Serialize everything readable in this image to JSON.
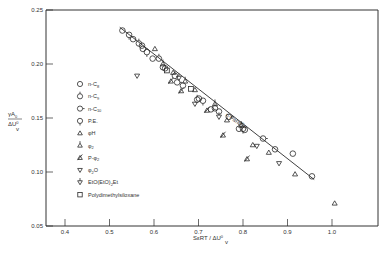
{
  "chart_data": {
    "type": "scatter",
    "title": "",
    "xlabel": "SεRT / ΔU_v^0",
    "ylabel": "γA_0 / ΔU_v^0",
    "xlim": [
      0.34,
      1.09
    ],
    "ylim": [
      0.05,
      0.25
    ],
    "x_ticks": [
      0.4,
      0.5,
      0.6,
      0.7,
      0.8,
      0.9,
      1.0
    ],
    "x_tick_labels": [
      "0.4",
      "0.5",
      "0.6",
      "0.7",
      "0.8",
      "0.9",
      "1.0"
    ],
    "y_ticks": [
      0.05,
      0.1,
      0.15,
      0.2,
      0.25
    ],
    "y_tick_labels": [
      "0.05",
      "0.10",
      "0.15",
      "0.20",
      "0.25"
    ],
    "grid": false,
    "legend_position": "inside-left",
    "reference_line": {
      "label": "n-Paraffin",
      "x": [
        0.523,
        0.96
      ],
      "y": [
        0.234,
        0.093
      ]
    },
    "series": [
      {
        "name": "n-C8",
        "marker": "circle",
        "points": [
          [
            0.529,
            0.231
          ],
          [
            0.553,
            0.223
          ],
          [
            0.573,
            0.217
          ],
          [
            0.597,
            0.205
          ],
          [
            0.625,
            0.196
          ],
          [
            0.665,
            0.18
          ],
          [
            0.701,
            0.168
          ],
          [
            0.746,
            0.156
          ],
          [
            0.804,
            0.139
          ],
          [
            0.872,
            0.121
          ],
          [
            0.912,
            0.117
          ],
          [
            0.955,
            0.096
          ]
        ]
      },
      {
        "name": "n-C9",
        "marker": "circle-tick-top",
        "points": [
          [
            0.566,
            0.219
          ],
          [
            0.611,
            0.205
          ],
          [
            0.647,
            0.189
          ],
          [
            0.697,
            0.167
          ],
          [
            0.737,
            0.159
          ],
          [
            0.791,
            0.14
          ]
        ]
      },
      {
        "name": "n-C10",
        "marker": "circle-tick-right",
        "points": [
          [
            0.575,
            0.214
          ],
          [
            0.62,
            0.197
          ],
          [
            0.652,
            0.183
          ],
          [
            0.728,
            0.158
          ],
          [
            0.768,
            0.151
          ],
          [
            0.845,
            0.131
          ]
        ]
      },
      {
        "name": "P.E.",
        "marker": "circle-tick-bottom",
        "points": [
          [
            0.544,
            0.227
          ],
          [
            0.584,
            0.211
          ],
          [
            0.71,
            0.166
          ],
          [
            0.8,
            0.14
          ]
        ]
      },
      {
        "name": "φH",
        "marker": "triangle-up",
        "points": [
          [
            0.602,
            0.214
          ],
          [
            0.643,
            0.192
          ],
          [
            0.692,
            0.176
          ],
          [
            0.764,
            0.148
          ],
          [
            0.822,
            0.125
          ],
          [
            0.858,
            0.118
          ],
          [
            0.917,
            0.098
          ],
          [
            1.006,
            0.071
          ]
        ]
      },
      {
        "name": "φ2",
        "marker": "triangle-up-tick",
        "points": [
          [
            0.62,
            0.2
          ],
          [
            0.67,
            0.184
          ],
          [
            0.737,
            0.163
          ],
          [
            0.796,
            0.143
          ]
        ]
      },
      {
        "name": "P-φ2",
        "marker": "triangle-up-slash",
        "points": [
          [
            0.638,
            0.184
          ],
          [
            0.661,
            0.175
          ],
          [
            0.719,
            0.157
          ],
          [
            0.755,
            0.134
          ],
          [
            0.809,
            0.112
          ]
        ]
      },
      {
        "name": "φ2O",
        "marker": "triangle-down",
        "points": [
          [
            0.562,
            0.189
          ],
          [
            0.692,
            0.163
          ],
          [
            0.831,
            0.124
          ],
          [
            0.881,
            0.108
          ]
        ]
      },
      {
        "name": "EtO(EtO)2Et",
        "marker": "triangle-down-tick",
        "points": [
          [
            0.656,
            0.187
          ],
          [
            0.746,
            0.151
          ]
        ]
      },
      {
        "name": "Polydimethylsiloxane",
        "marker": "square",
        "points": [
          [
            0.629,
            0.194
          ],
          [
            0.683,
            0.177
          ]
        ]
      }
    ]
  },
  "legend": {
    "items": [
      {
        "label": "n-C",
        "sub": "8",
        "marker": "circle"
      },
      {
        "label": "n-C",
        "sub": "9",
        "marker": "circle-tick-top"
      },
      {
        "label": "n-C",
        "sub": "10",
        "marker": "circle-tick-right"
      },
      {
        "label": "P.E.",
        "sub": "",
        "marker": "circle-tick-bottom"
      },
      {
        "label": "φH",
        "sub": "",
        "marker": "triangle-up"
      },
      {
        "label": "φ",
        "sub": "2",
        "marker": "triangle-up-tick"
      },
      {
        "label": "P-φ",
        "sub": "2",
        "marker": "triangle-up-slash"
      },
      {
        "label": "φ",
        "sub": "2",
        "suffix": "O",
        "marker": "triangle-down"
      },
      {
        "label": "EtO(EtO)",
        "sub": "2",
        "suffix": "Et",
        "marker": "triangle-down-tick"
      },
      {
        "label": "Polydimethylsiloxane",
        "sub": "",
        "marker": "square"
      }
    ]
  },
  "axes": {
    "y_label_num": "γA",
    "y_label_num_sub": "0",
    "y_label_den": "ΔU",
    "y_label_den_sup": "0",
    "y_label_den_sub": "v",
    "x_label": "SεRT / ΔU",
    "x_label_sup": "0",
    "x_label_sub": "v"
  },
  "colors": {
    "ink": "#2a2a2a",
    "frame": "#333333",
    "background": "#ffffff"
  }
}
